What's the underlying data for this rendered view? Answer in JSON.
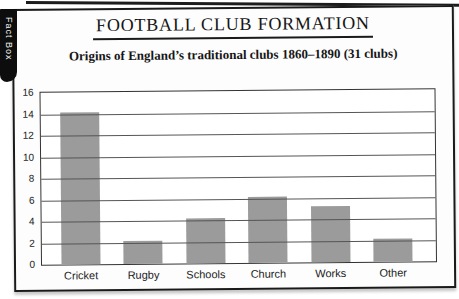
{
  "fact_box_tab": {
    "label": "Fact Box",
    "bg": "#0d0d0d",
    "text_color": "#f4f4f4"
  },
  "header": {
    "title": "FOOTBALL CLUB FORMATION",
    "subtitle": "Origins of England’s traditional clubs 1860–1890 (31 clubs)"
  },
  "chart_data": {
    "type": "bar",
    "title": "Origins of England’s traditional clubs 1860–1890 (31 clubs)",
    "categories": [
      "Cricket",
      "Rugby",
      "Schools",
      "Church",
      "Works",
      "Other"
    ],
    "values": [
      14,
      2,
      4,
      6,
      5,
      2
    ],
    "xlabel": "",
    "ylabel": "",
    "ylim": [
      0,
      16
    ],
    "yticks": [
      0,
      2,
      4,
      6,
      8,
      10,
      12,
      14,
      16
    ],
    "grid": true,
    "legend": false,
    "bar_color": "#9b9b9b",
    "axis_color": "#333333",
    "gridline_color": "#555555"
  }
}
